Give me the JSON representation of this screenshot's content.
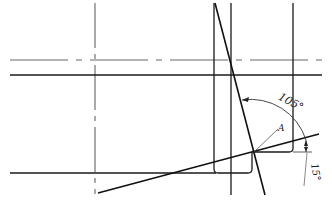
{
  "diagram": {
    "type": "engineering-drawing",
    "labels": {
      "angle_large": "105°",
      "angle_small": "15°",
      "point": "A"
    },
    "colors": {
      "line": "#1a1a1a",
      "centerline": "#555555",
      "background": "#ffffff"
    }
  }
}
